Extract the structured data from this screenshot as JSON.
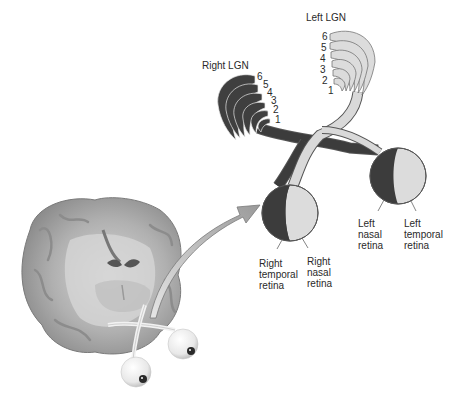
{
  "diagram": {
    "title_labels": {
      "left_lgn": "Left LGN",
      "right_lgn": "Right LGN"
    },
    "left_lgn_layers": [
      "6",
      "5",
      "4",
      "3",
      "2",
      "1"
    ],
    "right_lgn_layers": [
      "6",
      "5",
      "4",
      "3",
      "2",
      "1"
    ],
    "retina_labels": {
      "right_temporal": "Right\ntemporal\nretina",
      "right_nasal": "Right\nnasal\nretina",
      "left_nasal": "Left\nnasal\nretina",
      "left_temporal": "Left\ntemporal\nretina"
    },
    "colors": {
      "dark_pathway": "#3c3c3c",
      "light_pathway": "#d9d9d9",
      "outline": "#555555",
      "arrow": "#b5b5b5",
      "brain": "#a9a9a9"
    },
    "elements": [
      "brain-cross-section",
      "eyeballs",
      "optic-chiasm",
      "lgn-layers",
      "zoom-arrow"
    ]
  }
}
